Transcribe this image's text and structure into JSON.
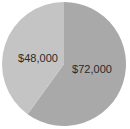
{
  "chart_data": {
    "type": "pie",
    "title": "",
    "categories": [
      "Slice A",
      "Slice B"
    ],
    "values": [
      72000,
      48000
    ],
    "labels": [
      "$72,000",
      "$48,000"
    ],
    "colors": [
      "#a9a9a9",
      "#c4c4c4"
    ],
    "start_angle": "top, clockwise",
    "legend": "none"
  }
}
